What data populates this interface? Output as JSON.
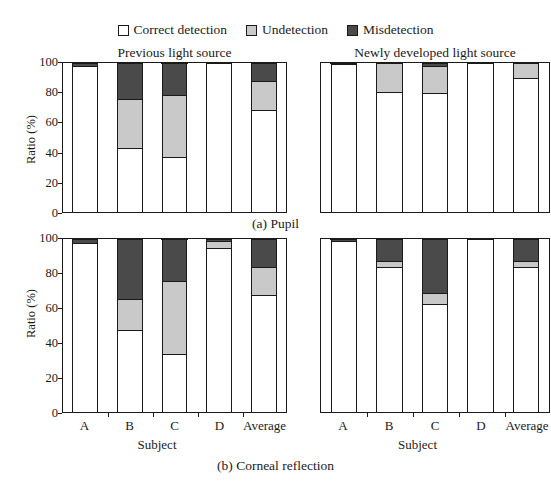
{
  "legend": {
    "items": [
      {
        "label": "Correct detection",
        "key": "correct",
        "color": "#ffffff",
        "icon": "legend-swatch-correct"
      },
      {
        "label": "Undetection",
        "key": "under",
        "color": "#c9c9c9",
        "icon": "legend-swatch-undetection"
      },
      {
        "label": "Misdetection",
        "key": "mis",
        "color": "#4a4a4a",
        "icon": "legend-swatch-misdetection"
      }
    ]
  },
  "axis": {
    "ylabel": "Ratio (%)",
    "xlabel": "Subject",
    "yticks": [
      "0",
      "20",
      "40",
      "60",
      "80",
      "100"
    ]
  },
  "groups": {
    "previous": "Previous light source",
    "newly": "Newly developed light source"
  },
  "captions": {
    "a": "(a) Pupil",
    "b": "(b) Corneal reflection"
  },
  "categories": [
    "A",
    "B",
    "C",
    "D",
    "Average"
  ],
  "chart_data": {
    "type": "bar",
    "subtype": "stacked-bar",
    "title": "",
    "xlabel": "Subject",
    "ylabel": "Ratio (%)",
    "ylim": [
      0,
      100
    ],
    "grid": false,
    "legend_position": "top-center",
    "legend_entries": [
      "Correct detection",
      "Undetection",
      "Misdetection"
    ],
    "series_colors": {
      "Correct detection": "#ffffff",
      "Undetection": "#c9c9c9",
      "Misdetection": "#4a4a4a"
    },
    "categories": [
      "A",
      "B",
      "C",
      "D",
      "Average"
    ],
    "panels": [
      {
        "id": "a-previous",
        "caption": "(a) Pupil",
        "group": "Previous light source",
        "series": [
          {
            "name": "Correct detection",
            "values": [
              97.0,
              42.0,
              36.0,
              99.5,
              68.0
            ]
          },
          {
            "name": "Undetection",
            "values": [
              0.0,
              33.0,
              42.0,
              0.0,
              19.0
            ]
          },
          {
            "name": "Misdetection",
            "values": [
              3.0,
              25.0,
              22.0,
              0.5,
              13.0
            ]
          }
        ]
      },
      {
        "id": "a-newly",
        "caption": "(a) Pupil",
        "group": "Newly developed light source",
        "series": [
          {
            "name": "Correct detection",
            "values": [
              98.5,
              80.0,
              79.0,
              100.0,
              89.5
            ]
          },
          {
            "name": "Undetection",
            "values": [
              0.0,
              20.0,
              18.0,
              0.0,
              10.5
            ]
          },
          {
            "name": "Misdetection",
            "values": [
              1.5,
              0.0,
              3.0,
              0.0,
              0.0
            ]
          }
        ]
      },
      {
        "id": "b-previous",
        "caption": "(b) Corneal reflection",
        "group": "Previous light source",
        "series": [
          {
            "name": "Correct detection",
            "values": [
              97.0,
              47.0,
              33.0,
              94.5,
              67.0
            ]
          },
          {
            "name": "Undetection",
            "values": [
              0.0,
              18.0,
              42.0,
              3.5,
              16.0
            ]
          },
          {
            "name": "Misdetection",
            "values": [
              3.0,
              35.0,
              25.0,
              2.0,
              17.0
            ]
          }
        ]
      },
      {
        "id": "b-newly",
        "caption": "(b) Corneal reflection",
        "group": "Newly developed light source",
        "series": [
          {
            "name": "Correct detection",
            "values": [
              98.0,
              83.0,
              62.0,
              100.0,
              83.0
            ]
          },
          {
            "name": "Undetection",
            "values": [
              0.0,
              4.0,
              6.0,
              0.0,
              4.0
            ]
          },
          {
            "name": "Misdetection",
            "values": [
              2.0,
              13.0,
              32.0,
              0.0,
              13.0
            ]
          }
        ]
      }
    ]
  }
}
